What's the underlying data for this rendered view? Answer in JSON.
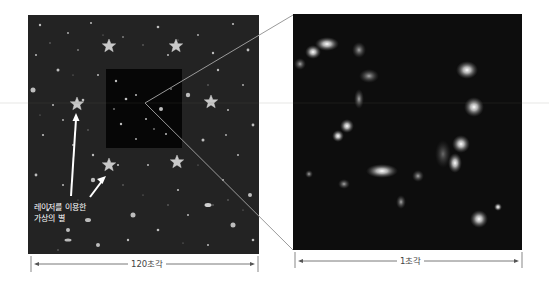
{
  "left_panel": {
    "annotation_line1": "레이저를 이용한",
    "annotation_line2": "가상의 별",
    "scale_label": "120초각",
    "stars": [
      {
        "x": 109,
        "y": 46
      },
      {
        "x": 176,
        "y": 46
      },
      {
        "x": 77,
        "y": 104
      },
      {
        "x": 211,
        "y": 102
      },
      {
        "x": 109,
        "y": 165
      },
      {
        "x": 177,
        "y": 162
      }
    ]
  },
  "right_panel": {
    "scale_label": "1초각"
  },
  "colors": {
    "background": "#ffffff",
    "sky": "#232323",
    "zoom_sky": "#0d0d0d",
    "callout_line": "#9a9a9a",
    "star": "#c8c8c8"
  }
}
